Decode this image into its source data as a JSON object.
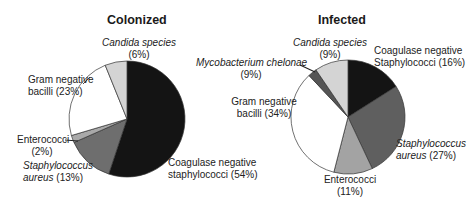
{
  "chart_data": [
    {
      "type": "pie",
      "title": "Colonized",
      "categories": [
        "Coagulase negative staphylococci",
        "Staphylococcus aureus",
        "Enterococci",
        "Gram negative bacilli",
        "Candida species"
      ],
      "values": [
        54,
        13,
        2,
        23,
        6
      ],
      "unit": "%",
      "colors": [
        "#141414",
        "#6e6e6e",
        "#a9a9a9",
        "#ffffff",
        "#d4d4d4"
      ]
    },
    {
      "type": "pie",
      "title": "Infected",
      "categories": [
        "Coagulase negative Staphylococci",
        "Staphylococcus aureus",
        "Enterococci",
        "Gram negative bacilli",
        "Mycobacterium chelonae",
        "Candida species"
      ],
      "values": [
        16,
        27,
        11,
        34,
        9,
        9
      ],
      "unit": "%",
      "colors": [
        "#141414",
        "#5f5f5f",
        "#a3a3a3",
        "#ffffff",
        "#555555",
        "#d4d4d4"
      ]
    }
  ],
  "colonized": {
    "title": "Colonized",
    "labels": {
      "candida_name": "Candida species",
      "candida_pct": "(6%)",
      "gnb_line1": "Gram negative",
      "gnb_line2": "bacilli (23%)",
      "entero_name": "Enterococci",
      "entero_pct": "(2%)",
      "saureus_name1": "Staphylococcus",
      "saureus_name2": "aureus",
      "saureus_pct": " (13%)",
      "cons_line1": "Coagulase negative",
      "cons_line2": "staphylococci (54%)"
    }
  },
  "infected": {
    "title": "Infected",
    "labels": {
      "candida_name": "Candida species",
      "candida_pct": "(9%)",
      "myco_name": "Mycobacterium chelonae",
      "myco_pct": "(9%)",
      "cons_line1": "Coagulase negative",
      "cons_line2": "Staphylococci (16%)",
      "gnb_line1": "Gram negative",
      "gnb_line2": "bacilli (34%)",
      "saureus_name1": "Staphylococcus",
      "saureus_name2": "aureus",
      "saureus_pct": " (27%)",
      "entero_name": "Enterococci",
      "entero_pct": "(11%)"
    }
  }
}
